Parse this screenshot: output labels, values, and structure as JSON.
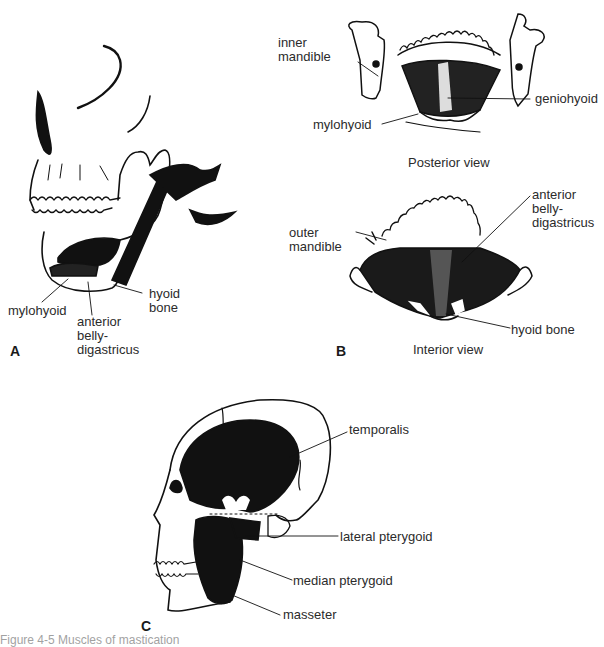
{
  "figure": {
    "panels": [
      {
        "id": "A",
        "letter": "A",
        "labels": {
          "mylohyoid": "mylohyoid",
          "anterior_belly_line1": "anterior",
          "anterior_belly_line2": "belly-",
          "anterior_belly_line3": "digastricus",
          "hyoid_line1": "hyoid",
          "hyoid_line2": "bone"
        }
      },
      {
        "id": "B",
        "letter": "B",
        "posterior": {
          "caption": "Posterior view",
          "labels": {
            "inner_mandible_line1": "inner",
            "inner_mandible_line2": "mandible",
            "geniohyoid": "geniohyoid",
            "mylohyoid": "mylohyoid"
          }
        },
        "interior": {
          "caption": "Interior view",
          "labels": {
            "outer_mandible_line1": "outer",
            "outer_mandible_line2": "mandible",
            "anterior_belly_line1": "anterior",
            "anterior_belly_line2": "belly-",
            "anterior_belly_line3": "digastricus",
            "hyoid_bone": "hyoid bone"
          }
        }
      },
      {
        "id": "C",
        "letter": "C",
        "labels": {
          "temporalis": "temporalis",
          "lateral_pterygoid": "lateral pterygoid",
          "median_pterygoid": "median pterygoid",
          "masseter": "masseter"
        }
      }
    ],
    "caption_clipped": "Figure 4-5 Muscles of mastication"
  }
}
